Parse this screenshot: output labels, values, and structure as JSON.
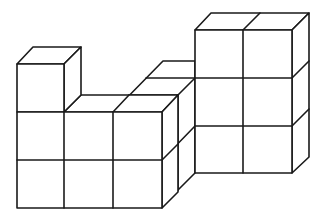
{
  "figure": {
    "stroke_color": "#1a1a1a",
    "background": "#ffffff",
    "cube_size_px": 48,
    "depth_offset_px": [
      16,
      -16
    ],
    "groups": [
      {
        "name": "left-front-block",
        "columns": 3,
        "rows": 2,
        "extra_top_cube_column": 1
      },
      {
        "name": "middle-back-cubes",
        "count": 2
      },
      {
        "name": "right-tower",
        "columns": 2,
        "rows": 3
      }
    ]
  }
}
